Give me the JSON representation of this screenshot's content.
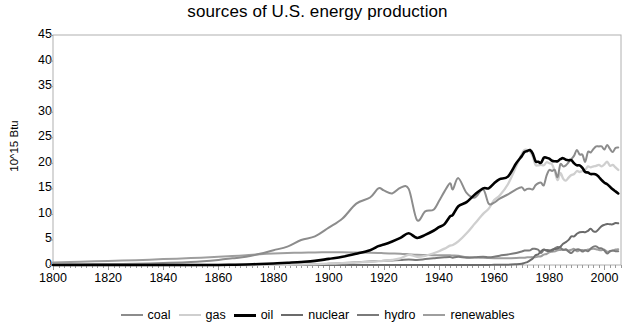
{
  "chart_data": {
    "type": "line",
    "title": "sources of U.S. energy production",
    "xlabel": "",
    "ylabel": "10^15 Btu",
    "xlim": [
      1800,
      2006
    ],
    "ylim": [
      0,
      45
    ],
    "ytick_step": 5,
    "xtick_step": 20,
    "grid": false,
    "legend_position": "bottom",
    "xticks": [
      "1800",
      "1820",
      "1840",
      "1860",
      "1880",
      "1900",
      "1920",
      "1940",
      "1960",
      "1980",
      "2000"
    ],
    "yticks": [
      "0",
      "5",
      "10",
      "15",
      "20",
      "25",
      "30",
      "35",
      "40",
      "45"
    ],
    "x": [
      1800,
      1810,
      1820,
      1830,
      1840,
      1850,
      1860,
      1865,
      1870,
      1875,
      1880,
      1885,
      1890,
      1895,
      1900,
      1905,
      1910,
      1915,
      1918,
      1920,
      1923,
      1926,
      1929,
      1932,
      1935,
      1938,
      1940,
      1942,
      1944,
      1945,
      1947,
      1950,
      1953,
      1956,
      1958,
      1960,
      1962,
      1965,
      1968,
      1970,
      1971,
      1972,
      1973,
      1974,
      1975,
      1976,
      1977,
      1978,
      1979,
      1980,
      1981,
      1982,
      1983,
      1984,
      1985,
      1986,
      1987,
      1988,
      1989,
      1990,
      1991,
      1992,
      1993,
      1994,
      1995,
      1996,
      1997,
      1998,
      1999,
      2000,
      2001,
      2002,
      2003,
      2004,
      2005
    ],
    "series": [
      {
        "name": "coal",
        "color": "#8c8c8c",
        "width": 2.0,
        "values": [
          0.1,
          0.15,
          0.2,
          0.25,
          0.4,
          0.6,
          1.0,
          1.3,
          1.6,
          2.2,
          2.9,
          3.6,
          4.9,
          5.6,
          7.3,
          9.1,
          12.0,
          13.2,
          15.0,
          14.6,
          14.0,
          15.1,
          14.9,
          8.8,
          10.5,
          10.8,
          12.5,
          14.4,
          16.0,
          14.8,
          17.0,
          14.1,
          13.2,
          14.8,
          12.0,
          12.2,
          13.0,
          13.8,
          14.8,
          15.2,
          14.6,
          14.9,
          14.9,
          14.8,
          15.6,
          16.0,
          16.1,
          15.6,
          17.5,
          18.6,
          18.4,
          18.6,
          17.2,
          19.7,
          19.3,
          19.5,
          20.1,
          20.7,
          21.4,
          22.5,
          21.6,
          21.6,
          20.2,
          22.1,
          22.0,
          22.7,
          23.2,
          23.2,
          23.2,
          22.6,
          23.5,
          22.7,
          22.1,
          22.9,
          23.0
        ]
      },
      {
        "name": "gas",
        "color": "#cfcfcf",
        "width": 2.3,
        "values": [
          0,
          0,
          0,
          0,
          0,
          0,
          0,
          0,
          0,
          0.01,
          0.02,
          0.05,
          0.1,
          0.13,
          0.25,
          0.35,
          0.5,
          0.6,
          0.75,
          0.8,
          1.0,
          1.3,
          2.0,
          1.6,
          1.8,
          2.3,
          2.7,
          3.2,
          3.8,
          3.9,
          4.6,
          6.2,
          8.1,
          10.0,
          11.0,
          12.7,
          13.6,
          15.8,
          19.3,
          21.7,
          22.5,
          22.5,
          22.2,
          21.2,
          19.6,
          19.5,
          19.6,
          19.5,
          20.1,
          19.9,
          19.7,
          18.3,
          16.6,
          18.0,
          16.9,
          16.5,
          17.1,
          17.6,
          17.8,
          18.4,
          18.2,
          18.4,
          18.6,
          19.3,
          19.1,
          19.3,
          19.4,
          19.6,
          19.3,
          19.7,
          20.2,
          19.4,
          19.6,
          19.1,
          18.6
        ]
      },
      {
        "name": "oil",
        "color": "#000000",
        "width": 2.6,
        "values": [
          0,
          0,
          0,
          0,
          0,
          0,
          0.01,
          0.05,
          0.1,
          0.2,
          0.3,
          0.45,
          0.6,
          0.8,
          1.2,
          1.6,
          2.2,
          2.9,
          3.7,
          4.0,
          4.6,
          5.3,
          6.2,
          5.3,
          5.9,
          6.7,
          7.4,
          8.0,
          9.5,
          9.8,
          11.5,
          12.3,
          13.8,
          15.0,
          15.0,
          16.0,
          16.8,
          17.3,
          19.9,
          21.3,
          22.1,
          22.3,
          22.5,
          21.8,
          20.3,
          20.2,
          20.0,
          21.0,
          21.0,
          20.8,
          20.4,
          20.3,
          20.3,
          20.7,
          20.9,
          20.6,
          20.5,
          20.5,
          19.9,
          19.5,
          19.5,
          19.0,
          18.2,
          18.1,
          17.8,
          17.8,
          17.7,
          17.2,
          16.6,
          16.1,
          15.8,
          15.3,
          14.8,
          14.4,
          14.0
        ]
      },
      {
        "name": "nuclear",
        "color": "#6b6b6b",
        "width": 2.0,
        "values": [
          0,
          0,
          0,
          0,
          0,
          0,
          0,
          0,
          0,
          0,
          0,
          0,
          0,
          0,
          0,
          0,
          0,
          0,
          0,
          0,
          0,
          0,
          0,
          0,
          0,
          0,
          0,
          0,
          0,
          0,
          0,
          0,
          0,
          0.01,
          0.02,
          0.03,
          0.05,
          0.04,
          0.14,
          0.24,
          0.41,
          0.58,
          0.91,
          1.27,
          1.9,
          2.11,
          2.7,
          3.02,
          2.78,
          2.74,
          3.01,
          3.13,
          3.2,
          3.55,
          4.15,
          4.47,
          4.91,
          5.59,
          5.6,
          6.1,
          6.42,
          6.48,
          6.41,
          6.69,
          7.08,
          6.6,
          6.52,
          7.07,
          7.61,
          7.86,
          8.03,
          7.96,
          7.96,
          8.22,
          8.16
        ]
      },
      {
        "name": "hydro",
        "color": "#7a7a7a",
        "width": 2.0,
        "values": [
          0,
          0,
          0,
          0,
          0,
          0,
          0,
          0,
          0,
          0,
          0,
          0.01,
          0.03,
          0.08,
          0.25,
          0.38,
          0.54,
          0.68,
          0.78,
          0.82,
          0.9,
          0.96,
          1.1,
          1.0,
          1.15,
          1.3,
          1.42,
          1.5,
          1.55,
          1.44,
          1.6,
          1.42,
          1.5,
          1.6,
          1.5,
          1.6,
          1.82,
          2.06,
          2.35,
          2.65,
          2.83,
          2.86,
          2.86,
          3.18,
          3.15,
          2.98,
          2.33,
          2.94,
          2.93,
          2.9,
          2.76,
          3.27,
          3.53,
          3.38,
          2.97,
          3.07,
          2.63,
          2.33,
          2.84,
          3.05,
          3.02,
          2.62,
          2.89,
          2.68,
          3.2,
          3.59,
          3.64,
          3.3,
          3.27,
          2.81,
          2.24,
          2.69,
          2.83,
          2.69,
          2.7
        ]
      },
      {
        "name": "renewables",
        "color": "#9e9e9e",
        "width": 2.0,
        "values": [
          0.5,
          0.65,
          0.8,
          0.95,
          1.15,
          1.35,
          1.6,
          1.75,
          1.9,
          2.1,
          2.25,
          2.35,
          2.42,
          2.46,
          2.5,
          2.5,
          2.45,
          2.4,
          2.35,
          2.3,
          2.25,
          2.2,
          2.1,
          2.0,
          1.95,
          1.9,
          1.9,
          1.9,
          1.9,
          1.85,
          1.8,
          1.55,
          1.45,
          1.4,
          1.35,
          1.32,
          1.3,
          1.33,
          1.37,
          1.43,
          1.43,
          1.5,
          1.53,
          1.54,
          1.5,
          1.65,
          1.7,
          2.04,
          2.15,
          2.48,
          2.6,
          2.66,
          2.87,
          2.93,
          3.0,
          2.94,
          2.83,
          2.98,
          3.16,
          2.7,
          2.87,
          2.92,
          2.86,
          3.03,
          3.1,
          3.16,
          3.1,
          2.93,
          2.89,
          3.01,
          2.62,
          2.7,
          2.82,
          3.02,
          3.1
        ]
      }
    ]
  },
  "legend": {
    "items": [
      {
        "label": "coal",
        "color": "#8c8c8c",
        "width": 2.0
      },
      {
        "label": "gas",
        "color": "#cfcfcf",
        "width": 2.3
      },
      {
        "label": "oil",
        "color": "#000000",
        "width": 3.0
      },
      {
        "label": "nuclear",
        "color": "#6b6b6b",
        "width": 2.0
      },
      {
        "label": "hydro",
        "color": "#7a7a7a",
        "width": 2.0
      },
      {
        "label": "renewables",
        "color": "#9e9e9e",
        "width": 2.0
      }
    ]
  },
  "axes": {
    "frame_color": "#b0b0b0",
    "tick_color": "#9a9a9a"
  }
}
